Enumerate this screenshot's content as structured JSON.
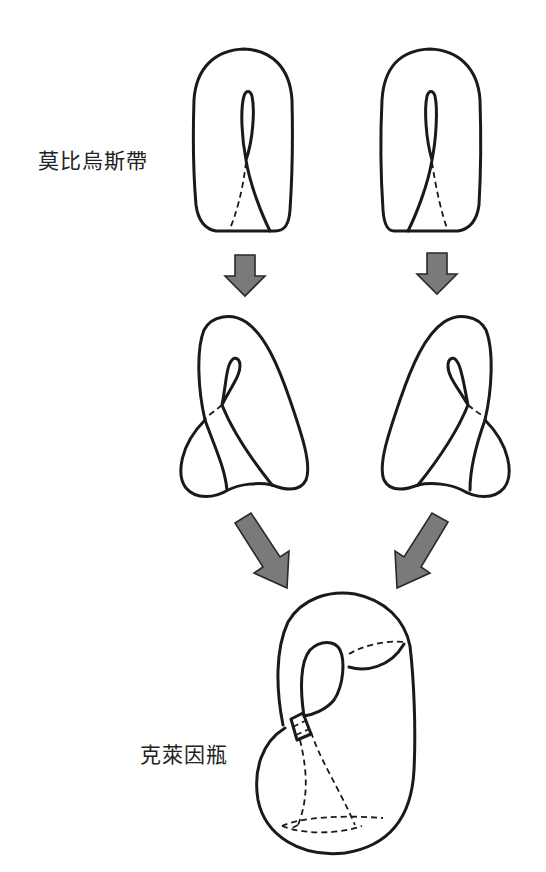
{
  "labels": {
    "mobius": "莫比烏斯帶",
    "klein": "克萊因瓶"
  },
  "colors": {
    "line": "#1a1a1a",
    "arrow_fill": "#7a7a7a",
    "arrow_stroke": "#2a2a2a",
    "background": "#ffffff"
  },
  "figures": [
    {
      "id": "mobius-left",
      "caption": "莫比烏斯帶"
    },
    {
      "id": "mobius-right",
      "caption": "莫比烏斯帶"
    },
    {
      "id": "deformed-left"
    },
    {
      "id": "deformed-right"
    },
    {
      "id": "klein-bottle",
      "caption": "克萊因瓶"
    }
  ],
  "arrows": [
    {
      "id": "arrow-down-left",
      "direction": "down"
    },
    {
      "id": "arrow-down-right",
      "direction": "down"
    },
    {
      "id": "arrow-diag-left",
      "direction": "down-right"
    },
    {
      "id": "arrow-diag-right",
      "direction": "down-left"
    }
  ]
}
